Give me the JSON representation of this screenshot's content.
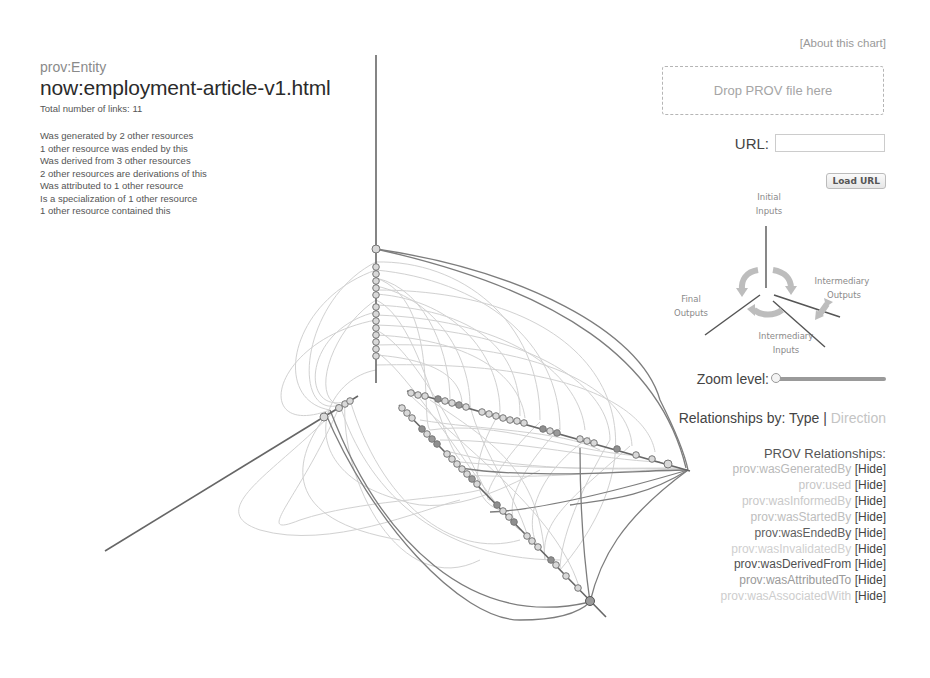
{
  "info": {
    "type": "prov:Entity",
    "name": "now:employment-article-v1.html",
    "total_links": "Total number of links: 11",
    "relations": [
      "Was generated by 2 other resources",
      "1 other resource was ended by this",
      "Was derived from 3 other resources",
      "2 other resources are derivations of this",
      "Was attributed to 1 other resource",
      "Is a specialization of 1 other resource",
      "1 other resource contained this"
    ]
  },
  "controls": {
    "about_link": "[About this chart]",
    "drop_zone": "Drop PROV file here",
    "url_label": "URL:",
    "url_value": "",
    "load_button": "Load URL",
    "zoom_label": "Zoom level:",
    "zoom_value": 0,
    "relationships_by_label": "Relationships by:",
    "relationships_by_options": [
      "Type",
      "Direction"
    ],
    "relationships_by_selected": "Type",
    "separator": "|"
  },
  "axis_legend": {
    "initial_inputs": [
      "Initial",
      "Inputs"
    ],
    "intermediary_outputs": [
      "Intermediary",
      "Outputs"
    ],
    "final_outputs": [
      "Final",
      "Outputs"
    ],
    "intermediary_inputs": [
      "Intermediary",
      "Inputs"
    ]
  },
  "prov_relationships": {
    "title": "PROV Relationships:",
    "hide_label": "[Hide]",
    "items": [
      {
        "name": "prov:wasGeneratedBy",
        "color": "#b9b9b9"
      },
      {
        "name": "prov:used",
        "color": "#c6c6c6"
      },
      {
        "name": "prov:wasInformedBy",
        "color": "#c9c9c9"
      },
      {
        "name": "prov:wasStartedBy",
        "color": "#bdbdbd"
      },
      {
        "name": "prov:wasEndedBy",
        "color": "#5e5e5e"
      },
      {
        "name": "prov:wasInvalidatedBy",
        "color": "#cfcfcf"
      },
      {
        "name": "prov:wasDerivedFrom",
        "color": "#505050"
      },
      {
        "name": "prov:wasAttributedTo",
        "color": "#9a9a9a"
      },
      {
        "name": "prov:wasAssociatedWith",
        "color": "#cdcdcd"
      }
    ]
  },
  "graph": {
    "axes": [
      {
        "name": "initial-inputs-axis",
        "x1": 376,
        "y1": 55,
        "x2": 376,
        "y2": 383
      },
      {
        "name": "final-outputs-axis",
        "x1": 105,
        "y1": 551,
        "x2": 356,
        "y2": 397
      },
      {
        "name": "intermediary-outputs-axis",
        "x1": 407,
        "y1": 391,
        "x2": 688,
        "y2": 470
      },
      {
        "name": "intermediary-inputs-axis",
        "x1": 399,
        "y1": 405,
        "x2": 606,
        "y2": 617
      }
    ],
    "colors": {
      "axis": "#666666",
      "node_fill": "#d6d6d6",
      "node_dark": "#8a8a8a",
      "node_stroke": "#777777",
      "link_light": "#c8c8c8",
      "link_dark": "#7a7a7a"
    }
  }
}
